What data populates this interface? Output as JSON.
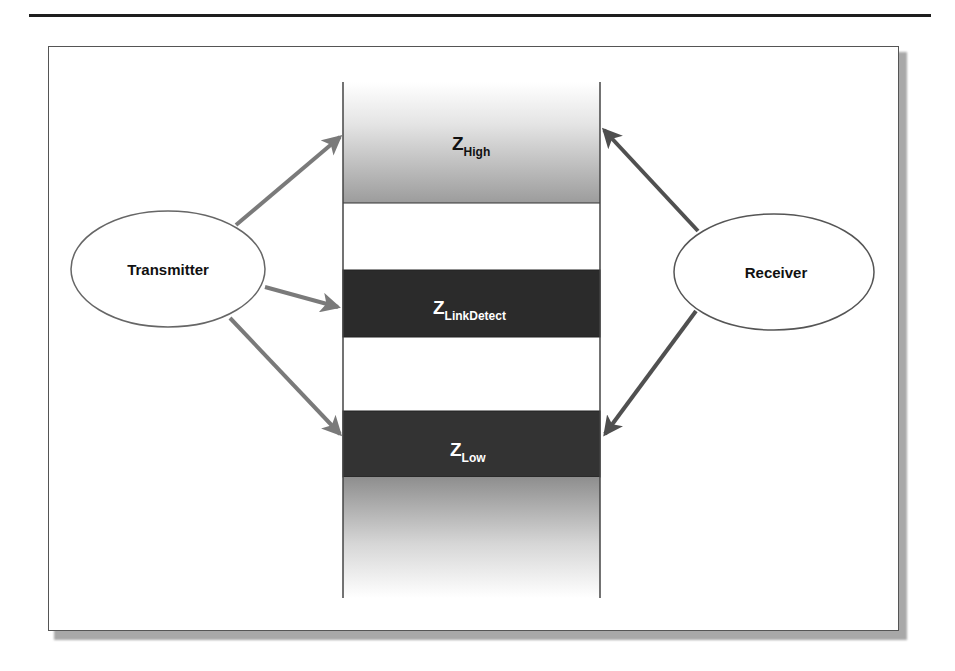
{
  "diagram": {
    "nodes": {
      "transmitter": {
        "label": "Transmitter"
      },
      "receiver": {
        "label": "Receiver"
      }
    },
    "bands": {
      "high": {
        "main": "Z",
        "sub": "High"
      },
      "link_detect": {
        "main": "Z",
        "sub": "LinkDetect"
      },
      "low": {
        "main": "Z",
        "sub": "Low"
      }
    },
    "edges": [
      {
        "from": "Transmitter",
        "to": "Z_High"
      },
      {
        "from": "Transmitter",
        "to": "Z_LinkDetect"
      },
      {
        "from": "Transmitter",
        "to": "Z_Low"
      },
      {
        "from": "Receiver",
        "to": "Z_High"
      },
      {
        "from": "Receiver",
        "to": "Z_Low"
      }
    ],
    "colors": {
      "transmitter_arrow": "#7a7a7a",
      "receiver_arrow": "#555555",
      "dark_band": "#2a2a2a",
      "gradient_gray": "#9a9a9a"
    }
  }
}
